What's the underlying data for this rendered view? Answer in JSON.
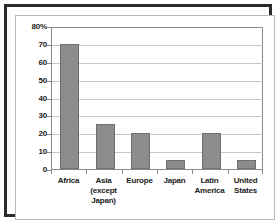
{
  "chart_data": {
    "type": "bar",
    "title": "",
    "subtitle": "",
    "xlabel": "",
    "ylabel": "",
    "categories": [
      "Africa",
      "Asia (except Japan)",
      "Europe",
      "Japan",
      "Latin America",
      "United States"
    ],
    "category_lines": [
      [
        "Africa"
      ],
      [
        "Asia",
        "(except",
        "Japan)"
      ],
      [
        "Europe"
      ],
      [
        "Japan"
      ],
      [
        "Latin",
        "America"
      ],
      [
        "United",
        "States"
      ]
    ],
    "values": [
      70,
      25,
      20,
      5,
      20,
      5
    ],
    "ylim": [
      0,
      80
    ],
    "ytick_values": [
      0,
      10,
      20,
      30,
      40,
      50,
      60,
      70,
      80
    ],
    "ytick_labels": [
      "0",
      "10",
      "20",
      "30",
      "40",
      "50",
      "60",
      "70",
      "80%"
    ],
    "grid": true,
    "legend": false,
    "legend_position": "none",
    "bar_color": "#8c8c8c",
    "bar_edge_color": "#6f6f6f",
    "gridline_color": "#c6c6c6",
    "axis_color": "#8a8a8a",
    "frame_color": "#2b2b2b",
    "background_color": "#ffffff",
    "text_color": "#1c1c1c"
  }
}
